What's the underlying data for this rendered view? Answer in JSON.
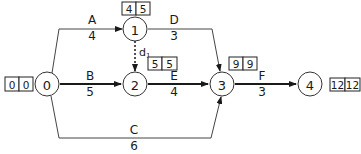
{
  "diagram": {
    "type": "activity-on-arrow network",
    "nodes": [
      {
        "id": "0",
        "label": "0",
        "es": "0",
        "ls": "0"
      },
      {
        "id": "1",
        "label": "1",
        "es": "4",
        "ls": "5"
      },
      {
        "id": "2",
        "label": "2",
        "es": "5",
        "ls": "5"
      },
      {
        "id": "3",
        "label": "3",
        "es": "9",
        "ls": "9"
      },
      {
        "id": "4",
        "label": "4",
        "es": "12",
        "ls": "12"
      }
    ],
    "edges": [
      {
        "id": "A",
        "name": "A",
        "duration": "4",
        "from": "0",
        "to": "1",
        "critical": false
      },
      {
        "id": "B",
        "name": "B",
        "duration": "5",
        "from": "0",
        "to": "2",
        "critical": true
      },
      {
        "id": "C",
        "name": "C",
        "duration": "6",
        "from": "0",
        "to": "3",
        "critical": false
      },
      {
        "id": "D",
        "name": "D",
        "duration": "3",
        "from": "1",
        "to": "3",
        "critical": false
      },
      {
        "id": "E",
        "name": "E",
        "duration": "4",
        "from": "2",
        "to": "3",
        "critical": true
      },
      {
        "id": "F",
        "name": "F",
        "duration": "3",
        "from": "3",
        "to": "4",
        "critical": true
      },
      {
        "id": "d1",
        "name": "d",
        "subscript": "1",
        "duration": "",
        "from": "1",
        "to": "2",
        "dummy": true
      }
    ]
  }
}
